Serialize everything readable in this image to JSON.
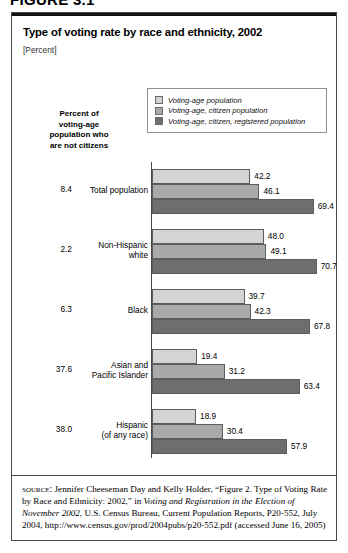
{
  "figure": {
    "number": "FIGURE 3.1"
  },
  "header": {
    "title": "Type of voting rate by race and ethnicity, 2002",
    "subtitle": "[Percent]"
  },
  "left_column": {
    "header_lines": [
      "Percent of",
      "voting-age",
      "population who",
      "are not citizens"
    ]
  },
  "legend": {
    "items": [
      {
        "label": "Voting-age population",
        "color": "#d4d4d4"
      },
      {
        "label": "Voting-age, citizen population",
        "color": "#a9a9a9"
      },
      {
        "label": "Voting-age, citizen, registered population",
        "color": "#6e6e6e"
      }
    ]
  },
  "chart_data": {
    "type": "bar",
    "orientation": "horizontal",
    "title": "Type of voting rate by race and ethnicity, 2002",
    "subtitle": "[Percent]",
    "xlabel": "",
    "ylabel": "",
    "xlim": [
      0,
      75
    ],
    "grid": false,
    "legend_position": "top-right",
    "categories": [
      "Total population",
      "Non-Hispanic white",
      "Black",
      "Asian and Pacific Islander",
      "Hispanic (of any race)"
    ],
    "series": [
      {
        "name": "Voting-age population",
        "color": "#d4d4d4",
        "values": [
          42.2,
          48.0,
          39.7,
          19.4,
          18.9
        ]
      },
      {
        "name": "Voting-age, citizen population",
        "color": "#a9a9a9",
        "values": [
          46.1,
          49.1,
          42.3,
          31.2,
          30.4
        ]
      },
      {
        "name": "Voting-age, citizen, registered population",
        "color": "#6e6e6e",
        "values": [
          69.4,
          70.7,
          67.8,
          63.4,
          57.9
        ]
      }
    ],
    "annotations": {
      "percent_not_citizens_label": "Percent of voting-age population who are not citizens",
      "percent_not_citizens": [
        8.4,
        2.2,
        6.3,
        37.6,
        38.0
      ]
    }
  },
  "groups": [
    {
      "pct": "8.4",
      "label_lines": [
        "Total population"
      ],
      "bars": [
        {
          "value": "42.2",
          "n": 42.2,
          "color": "#d4d4d4"
        },
        {
          "value": "46.1",
          "n": 46.1,
          "color": "#a9a9a9"
        },
        {
          "value": "69.4",
          "n": 69.4,
          "color": "#6e6e6e"
        }
      ]
    },
    {
      "pct": "2.2",
      "label_lines": [
        "Non-Hispanic",
        "white"
      ],
      "bars": [
        {
          "value": "48.0",
          "n": 48.0,
          "color": "#d4d4d4"
        },
        {
          "value": "49.1",
          "n": 49.1,
          "color": "#a9a9a9"
        },
        {
          "value": "70.7",
          "n": 70.7,
          "color": "#6e6e6e"
        }
      ]
    },
    {
      "pct": "6.3",
      "label_lines": [
        "Black"
      ],
      "bars": [
        {
          "value": "39.7",
          "n": 39.7,
          "color": "#d4d4d4"
        },
        {
          "value": "42.3",
          "n": 42.3,
          "color": "#a9a9a9"
        },
        {
          "value": "67.8",
          "n": 67.8,
          "color": "#6e6e6e"
        }
      ]
    },
    {
      "pct": "37.6",
      "label_lines": [
        "Asian and",
        "Pacific Islander"
      ],
      "bars": [
        {
          "value": "19.4",
          "n": 19.4,
          "color": "#d4d4d4"
        },
        {
          "value": "31.2",
          "n": 31.2,
          "color": "#a9a9a9"
        },
        {
          "value": "63.4",
          "n": 63.4,
          "color": "#6e6e6e"
        }
      ]
    },
    {
      "pct": "38.0",
      "label_lines": [
        "Hispanic",
        "(of any race)"
      ],
      "bars": [
        {
          "value": "18.9",
          "n": 18.9,
          "color": "#d4d4d4"
        },
        {
          "value": "30.4",
          "n": 30.4,
          "color": "#a9a9a9"
        },
        {
          "value": "57.9",
          "n": 57.9,
          "color": "#6e6e6e"
        }
      ]
    }
  ],
  "source": {
    "label": "source:",
    "text_part1": " Jennifer Cheeseman Day and Kelly Holder, “Figure 2. Type of Voting Rate by Race and Ethnicity: 2002,” in ",
    "italic1": "Voting and Registration in the Election of November 2002",
    "text_part2": ", U.S. Census Bureau, Current Population Reports, P20-552, July 2004, http://www.census.gov/prod/2004pubs/p20-552.pdf (accessed June 16, 2005)"
  }
}
